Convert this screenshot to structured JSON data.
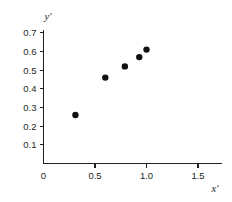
{
  "chart_data": {
    "type": "scatter",
    "title": "",
    "xlabel": "x′",
    "ylabel": "y′",
    "xlim": [
      0,
      1.6
    ],
    "ylim": [
      0,
      0.75
    ],
    "grid": false,
    "legend": null,
    "x_ticks": [
      {
        "value": 0,
        "label": "0"
      },
      {
        "value": 0.5,
        "label": "0.5"
      },
      {
        "value": 1.0,
        "label": "1.0"
      },
      {
        "value": 1.5,
        "label": "1.5"
      }
    ],
    "y_ticks": [
      {
        "value": 0.1,
        "label": "0.1"
      },
      {
        "value": 0.2,
        "label": "0.2"
      },
      {
        "value": 0.3,
        "label": "0.3"
      },
      {
        "value": 0.4,
        "label": "0.4"
      },
      {
        "value": 0.5,
        "label": "0.5"
      },
      {
        "value": 0.6,
        "label": "0.6"
      },
      {
        "value": 0.7,
        "label": "0.7"
      }
    ],
    "x": [
      0.31,
      0.6,
      0.79,
      0.93,
      1.0
    ],
    "y": [
      0.26,
      0.46,
      0.52,
      0.57,
      0.61
    ],
    "points": [
      {
        "x": 0.31,
        "y": 0.26
      },
      {
        "x": 0.6,
        "y": 0.46
      },
      {
        "x": 0.79,
        "y": 0.52
      },
      {
        "x": 0.93,
        "y": 0.57
      },
      {
        "x": 1.0,
        "y": 0.61
      }
    ],
    "marker": {
      "shape": "circle",
      "color": "#111111",
      "size": 3.2
    }
  }
}
